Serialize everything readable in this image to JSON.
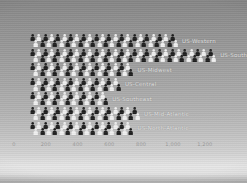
{
  "slide": {
    "kind": "photographed presentation slide",
    "background_top_color": "#8a8a8a",
    "background_mid_color": "#a9a9a9",
    "background_light_band_color": "#e4e4e4",
    "background_bottom_edge_color": "#a5a5a5"
  },
  "chart_data": {
    "type": "bar",
    "subtype": "pictograph",
    "orientation": "horizontal",
    "title": "",
    "xlabel": "",
    "ylabel": "",
    "categories": [
      "US-Western",
      "US-Southwest",
      "US-Midwest",
      "US-Central",
      "US-Southeast",
      "US-Mid-Atlantic",
      "US-North-Atlantic"
    ],
    "values": [
      1040,
      1250,
      740,
      675,
      590,
      770,
      730
    ],
    "icons_per_line": [
      23,
      29,
      16,
      14,
      12,
      17,
      16
    ],
    "icon": "person-icon",
    "icon_dark_color": "#1e1e1e",
    "icon_light_color": "#efefef",
    "row_label_color": "#e3e3e3",
    "x_ticks": [
      "0",
      "200",
      "400",
      "600",
      "800",
      "1,000",
      "1,200"
    ],
    "tick_color": "#9a9a9a",
    "xlim": [
      0,
      1300
    ],
    "grid": false,
    "legend": "none"
  }
}
